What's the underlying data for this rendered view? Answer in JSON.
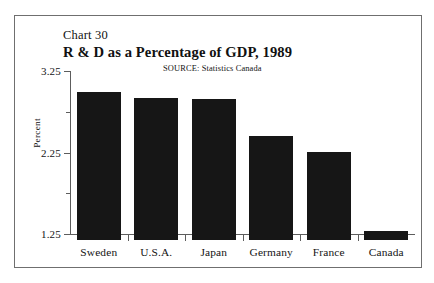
{
  "figure": {
    "chart_number": "Chart 30",
    "title": "R & D as a Percentage of GDP, 1989",
    "source": "SOURCE: Statistics Canada",
    "y_axis_title": "Percent",
    "border_color": "#6f6f6f",
    "bar_color": "#161616",
    "background_color": "#ffffff"
  },
  "chart_data": {
    "type": "bar",
    "title": "R & D as a Percentage of GDP, 1989",
    "subtitle": "Chart 30",
    "annotations": [
      "SOURCE: Statistics Canada"
    ],
    "xlabel": "",
    "ylabel": "Percent",
    "ylim": [
      1.25,
      3.25
    ],
    "grid": false,
    "legend": null,
    "categories": [
      "Sweden",
      "U.S.A.",
      "Japan",
      "Germany",
      "France",
      "Canada"
    ],
    "values": [
      3.07,
      2.99,
      2.98,
      2.53,
      2.33,
      1.36
    ],
    "y_ticks_major": [
      "3.25",
      "2.25",
      "1.25"
    ],
    "y_tick_values_major": [
      3.25,
      2.25,
      1.25
    ],
    "y_tick_values_minor": [
      2.75,
      1.75
    ]
  }
}
